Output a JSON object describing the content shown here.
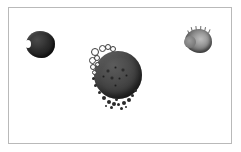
{
  "figure": {
    "background_color": "#ffffff",
    "frame_color": "#b9b9b9",
    "frame": {
      "x": 8,
      "y": 7,
      "width": 224,
      "height": 137
    }
  },
  "specimens": [
    {
      "id": "left-particle",
      "label": "small dark particle",
      "shape": "irregular-round",
      "x": 25,
      "y": 30,
      "width": 29,
      "height": 27,
      "fill_color": "#3a3a3a",
      "core_color": "#222222",
      "highlight_color": "#4a4a4a"
    },
    {
      "id": "center-sphere",
      "label": "large dark sphere with budding vesicles",
      "shape": "sphere",
      "x": 88,
      "y": 42,
      "width": 58,
      "height": 68,
      "fill_color": "#4e4e4e",
      "core_color": "#242424",
      "highlight_color": "#5c5c5c",
      "surface_pits": [
        {
          "x": 17,
          "y": 26,
          "d": 4
        },
        {
          "x": 25,
          "y": 23,
          "d": 3
        },
        {
          "x": 32,
          "y": 25,
          "d": 4
        },
        {
          "x": 21,
          "y": 33,
          "d": 4
        },
        {
          "x": 29,
          "y": 34,
          "d": 3
        },
        {
          "x": 36,
          "y": 31,
          "d": 3
        },
        {
          "x": 13,
          "y": 32,
          "d": 3
        },
        {
          "x": 25,
          "y": 41,
          "d": 3
        }
      ],
      "vesicles": [
        {
          "x": 2,
          "y": 5,
          "d": 6
        },
        {
          "x": 10,
          "y": 2,
          "d": 5
        },
        {
          "x": 16,
          "y": 1,
          "d": 4
        },
        {
          "x": 21,
          "y": 3,
          "d": 4
        },
        {
          "x": 0,
          "y": 14,
          "d": 5
        },
        {
          "x": 5,
          "y": 12,
          "d": 4
        },
        {
          "x": 1,
          "y": 21,
          "d": 4
        },
        {
          "x": 6,
          "y": 19,
          "d": 3
        },
        {
          "x": 3,
          "y": 27,
          "d": 3
        }
      ],
      "granules": [
        {
          "x": 13,
          "y": 53,
          "d": 4
        },
        {
          "x": 18,
          "y": 57,
          "d": 4
        },
        {
          "x": 23,
          "y": 59,
          "d": 4
        },
        {
          "x": 28,
          "y": 60,
          "d": 3
        },
        {
          "x": 33,
          "y": 58,
          "d": 4
        },
        {
          "x": 38,
          "y": 55,
          "d": 4
        },
        {
          "x": 42,
          "y": 51,
          "d": 3
        },
        {
          "x": 9,
          "y": 48,
          "d": 3
        },
        {
          "x": 21,
          "y": 63,
          "d": 3
        },
        {
          "x": 31,
          "y": 64,
          "d": 3
        },
        {
          "x": 26,
          "y": 55,
          "d": 3
        },
        {
          "x": 45,
          "y": 46,
          "d": 3
        },
        {
          "x": 5,
          "y": 41,
          "d": 3
        },
        {
          "x": 3,
          "y": 34,
          "d": 3
        },
        {
          "x": 36,
          "y": 63,
          "d": 2
        },
        {
          "x": 16,
          "y": 62,
          "d": 2
        }
      ]
    },
    {
      "id": "right-particle",
      "label": "light gray irregular particle",
      "shape": "irregular-lobed",
      "x": 183,
      "y": 25,
      "width": 30,
      "height": 28,
      "fill_color": "#a3a3a3",
      "core_color": "#5e5e5e",
      "highlight_color": "#bdbdbd",
      "spikes": [
        {
          "x": 8,
          "y": 1,
          "h": 5,
          "rot": -16
        },
        {
          "x": 12,
          "y": 0,
          "h": 6,
          "rot": -6
        },
        {
          "x": 16,
          "y": 0,
          "h": 6,
          "rot": 3
        },
        {
          "x": 20,
          "y": 1,
          "h": 5,
          "rot": 12
        },
        {
          "x": 24,
          "y": 3,
          "h": 4,
          "rot": 24
        },
        {
          "x": 5,
          "y": 4,
          "h": 4,
          "rot": -28
        }
      ]
    }
  ]
}
